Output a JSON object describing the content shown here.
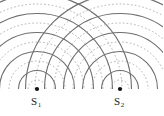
{
  "figure": {
    "width": 163,
    "height": 116,
    "background_color": "#ffffff"
  },
  "colors": {
    "crest_arc": "#6e6e6e",
    "trough_arc": "#a8a8a8",
    "source_dot": "#111111",
    "label_text": "#1a1a1a"
  },
  "geometry": {
    "baseline_y": 89,
    "arc_spacing": 9.5,
    "max_radius": 96,
    "crest_stroke_width": 1.1,
    "trough_stroke_width": 0.9,
    "trough_dash": "1.6 2.2",
    "source_dot_radius": 2.1
  },
  "sources": [
    {
      "id": "s1",
      "label_main": "S",
      "label_sub": "1",
      "x": 37,
      "y": 89,
      "label_x": 31,
      "label_y": 96,
      "first_radius": 9,
      "arc_count": 10
    },
    {
      "id": "s2",
      "label_main": "S",
      "label_sub": "2",
      "x": 120,
      "y": 89,
      "label_x": 114,
      "label_y": 96,
      "first_radius": 9,
      "arc_count": 10
    }
  ],
  "legend_note": {
    "crest": "solid dark-gray arc",
    "trough": "dashed light-gray arc"
  }
}
